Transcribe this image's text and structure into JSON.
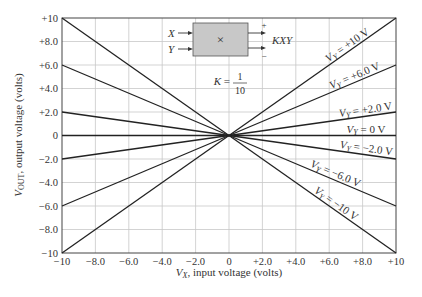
{
  "chart_data": {
    "type": "line",
    "title": "",
    "xlabel": "V_X, input voltage (volts)",
    "ylabel": "V_OUT, output voltage (volts)",
    "xlim": [
      -10,
      10
    ],
    "ylim": [
      -10,
      10
    ],
    "grid": true,
    "x_ticks": [
      "-10",
      "-8.0",
      "-6.0",
      "-4.0",
      "-2.0",
      "0",
      "+2.0",
      "+4.0",
      "+6.0",
      "+8.0",
      "+10"
    ],
    "y_ticks": [
      "+10",
      "+8.0",
      "+6.0",
      "+4.0",
      "+2.0",
      "0",
      "-2.0",
      "-4.0",
      "-6.0",
      "-8.0",
      "-10"
    ],
    "x": [
      -10,
      10
    ],
    "series": [
      {
        "name": "V_Y = +10 V",
        "vy": 10,
        "values": [
          -10,
          10
        ]
      },
      {
        "name": "V_Y = +6.0 V",
        "vy": 6,
        "values": [
          -6,
          6
        ]
      },
      {
        "name": "V_Y = +2.0 V",
        "vy": 2,
        "values": [
          -2,
          2
        ]
      },
      {
        "name": "V_Y = 0 V",
        "vy": 0,
        "values": [
          0,
          0
        ]
      },
      {
        "name": "V_Y = -2.0 V",
        "vy": -2,
        "values": [
          2,
          -2
        ]
      },
      {
        "name": "V_Y = -6.0 V",
        "vy": -6,
        "values": [
          6,
          -6
        ]
      },
      {
        "name": "V_Y = -10 V",
        "vy": -10,
        "values": [
          10,
          -10
        ]
      }
    ],
    "annotations": {
      "multiplier_inputs": [
        "X",
        "Y"
      ],
      "multiplier_symbol": "×",
      "output_label": "KXY",
      "output_plus": "+",
      "output_minus": "−",
      "gain_label": "K =",
      "gain_numerator": "1",
      "gain_denominator": "10"
    },
    "colors": {
      "line": "#222222",
      "grid": "#c8c8c8",
      "box_fill": "#c8c8c8"
    }
  }
}
